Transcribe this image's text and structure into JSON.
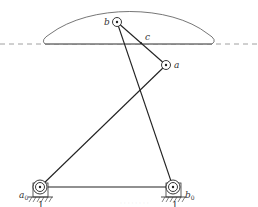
{
  "diagram": {
    "type": "four-bar linkage with coupler curve",
    "colors": {
      "link": "#222222",
      "curve": "#666666",
      "dashed": "#888888",
      "label": "#333333"
    },
    "labels": {
      "b": "b",
      "a": "a",
      "c": "c",
      "a0": "a",
      "a0_sub": "0",
      "b0": "b",
      "b0_sub": "0",
      "ground_left": "1",
      "ground_right": "1"
    },
    "joints": {
      "a": [
        166,
        65
      ],
      "b": [
        117,
        22
      ],
      "a0": [
        40,
        187
      ],
      "b0": [
        173,
        187
      ]
    },
    "caption": "· · · · · · · ·"
  }
}
